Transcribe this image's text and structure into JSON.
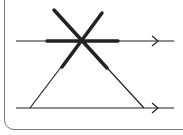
{
  "diagram": {
    "type": "geometry",
    "colors": {
      "stroke": "#222222",
      "frame": "#777777",
      "background": "#ffffff"
    },
    "parallel_lines": [
      {
        "id": "upper",
        "y": 41,
        "x1": 16,
        "x2": 174,
        "arrow_x": 158,
        "arrow_direction": "right"
      },
      {
        "id": "lower",
        "y": 108,
        "x1": 16,
        "x2": 174,
        "arrow_x": 158,
        "arrow_direction": "right"
      }
    ],
    "transversals": [
      {
        "id": "left",
        "x1": 30,
        "y1": 108,
        "x2": 102,
        "y2": 13,
        "thick_from_y": 68
      },
      {
        "id": "right",
        "x1": 144,
        "y1": 108,
        "x2": 54,
        "y2": 10,
        "thick_from_y": 68
      }
    ],
    "highlighted_segment": {
      "on": "upper",
      "x1": 47,
      "x2": 118
    },
    "intersection": {
      "x": 82,
      "y": 41
    }
  }
}
